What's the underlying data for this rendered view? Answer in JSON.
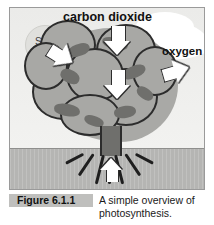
{
  "figure": {
    "caption_tag": "Figure 6.1.1",
    "caption_text": "A simple overview of photosynthesis.",
    "caption_line1": "A simple overview of",
    "caption_line2": "photosynthesis."
  },
  "diagram": {
    "labels": {
      "carbon_dioxide": "carbon dioxide",
      "oxygen": "oxygen",
      "sun": "Sun",
      "light_energy": "light\nenergy",
      "light_energy_line1": "light",
      "light_energy_line2": "energy",
      "chlorophyll_line1": "chlorophyll",
      "chlorophyll_line2": "traps light energy",
      "sugar": "sugar",
      "water": "water"
    },
    "arrows": [
      {
        "name": "carbon-dioxide-arrow",
        "direction": "down",
        "label": "carbon dioxide"
      },
      {
        "name": "light-energy-arrow",
        "direction": "right-down",
        "label": "light energy"
      },
      {
        "name": "oxygen-arrow",
        "direction": "right-up",
        "label": "oxygen"
      },
      {
        "name": "sugar-arrow",
        "direction": "down",
        "label": "sugar"
      },
      {
        "name": "water-arrow",
        "direction": "up",
        "label": "water"
      }
    ],
    "colors": {
      "frame_border": "#9a9a9a",
      "sky": "#ebebe9",
      "ground": "#b5b5b3",
      "foliage": "#a8a8a5",
      "foliage_dark": "#6f6f6c",
      "outline": "#2c2c2c",
      "arrow_fill": "#ffffff",
      "caption_tag_bg": "#bfbfbd"
    }
  }
}
